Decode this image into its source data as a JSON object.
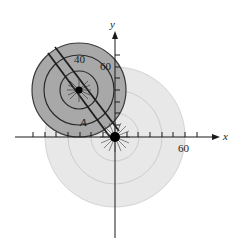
{
  "figure": {
    "axes": {
      "x_label": "x",
      "y_label": "y",
      "x_tick_label": "60",
      "y_tick_label": "60"
    },
    "dark_disk": {
      "ring_label": "40",
      "point_label": "A"
    },
    "colors": {
      "light_disk": "#e6e6e6",
      "light_rings": "#c8c8c8",
      "dark_disk": "#a6a6a6",
      "dark_rings": "#2a2a2a",
      "axis": "#1a1a1a"
    }
  }
}
